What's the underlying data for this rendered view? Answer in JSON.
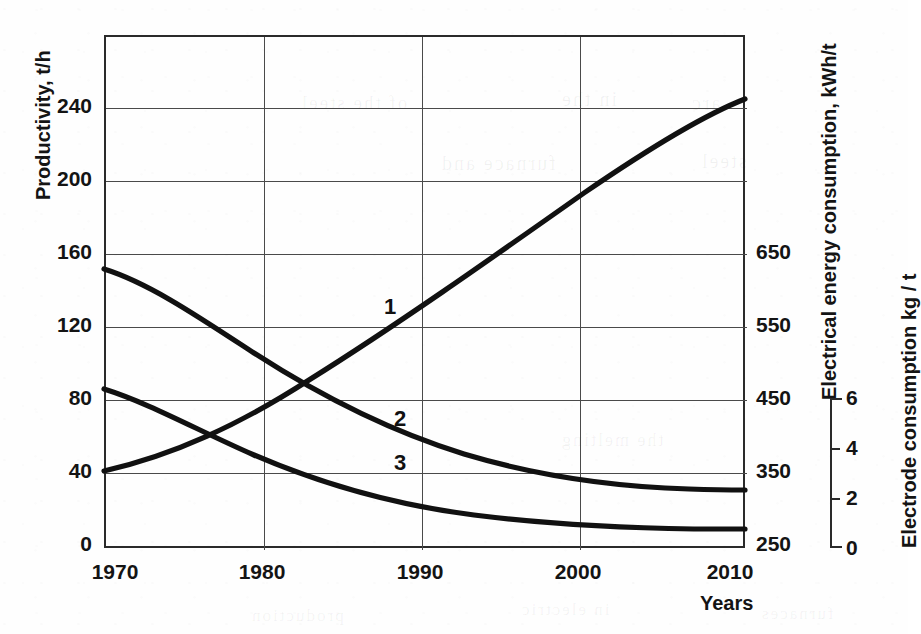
{
  "figure": {
    "background_color": "#fefefe",
    "ink_color": "#111111",
    "grid_color": "#4a4a4a"
  },
  "axes": {
    "x": {
      "title": "Years",
      "ticks": [
        "1970",
        "1980",
        "1990",
        "2000",
        "2010"
      ],
      "range": [
        1969,
        2011
      ]
    },
    "y_left": {
      "title": "Productivity, t/h",
      "ticks": [
        "0",
        "40",
        "80",
        "120",
        "160",
        "200",
        "240"
      ],
      "range": [
        0,
        280
      ]
    },
    "y_right_1": {
      "title": "Electrical energy consumption, kWh/t",
      "ticks": [
        "250",
        "350",
        "450",
        "550",
        "650"
      ],
      "range": [
        250,
        650
      ]
    },
    "y_right_2": {
      "title": "Electrode consumption kg / t",
      "ticks": [
        "0",
        "2",
        "4",
        "6"
      ],
      "range": [
        0,
        6
      ]
    }
  },
  "curve_labels": [
    {
      "text": "1",
      "x_px": 390,
      "y_px": 307
    },
    {
      "text": "2",
      "x_px": 400,
      "y_px": 419
    },
    {
      "text": "3",
      "x_px": 400,
      "y_px": 463
    }
  ],
  "ghost_text": [
    {
      "text": "of the steel",
      "x_px": 300,
      "y_px": 92,
      "size": 19
    },
    {
      "text": "in the",
      "x_px": 560,
      "y_px": 88,
      "size": 20
    },
    {
      "text": "arc",
      "x_px": 690,
      "y_px": 92,
      "size": 20
    },
    {
      "text": "furnace and",
      "x_px": 440,
      "y_px": 152,
      "size": 20
    },
    {
      "text": "steel",
      "x_px": 700,
      "y_px": 150,
      "size": 20
    },
    {
      "text": "the melting",
      "x_px": 560,
      "y_px": 430,
      "size": 18
    },
    {
      "text": "production",
      "x_px": 250,
      "y_px": 606,
      "size": 17
    },
    {
      "text": "in electric",
      "x_px": 520,
      "y_px": 600,
      "size": 17
    },
    {
      "text": "furnaces",
      "x_px": 760,
      "y_px": 604,
      "size": 17
    }
  ],
  "chart_data": {
    "type": "line",
    "title": "",
    "xlabel": "Years",
    "ylabel": "Productivity, t/h",
    "grid": true,
    "legend": "inline-numbered",
    "x": [
      1969,
      1970,
      1975,
      1980,
      1983,
      1985,
      1990,
      1995,
      2000,
      2005,
      2010,
      2011
    ],
    "xlim": [
      1969,
      2011
    ],
    "ylim_left": [
      0,
      280
    ],
    "ylim_right_energy": [
      250,
      650
    ],
    "ylim_right_electrode": [
      0,
      6
    ],
    "series": [
      {
        "name": "1",
        "label": "Productivity",
        "axis": "y_left",
        "units": "t/h",
        "values": [
          41,
          42,
          56,
          72,
          85,
          93,
          120,
          150,
          175,
          205,
          238,
          240
        ]
      },
      {
        "name": "2",
        "label": "Electrical energy consumption",
        "axis": "y_right_1",
        "units": "kWh/t",
        "values_left_scale": [
          152,
          150,
          128,
          108,
          95,
          88,
          70,
          56,
          45,
          38,
          35,
          35
        ],
        "values": [
          630,
          625,
          570,
          520,
          488,
          470,
          425,
          390,
          363,
          345,
          338,
          338
        ]
      },
      {
        "name": "3",
        "label": "Electrode consumption",
        "axis": "y_right_2",
        "units": "kg/t",
        "values_left_scale": [
          87,
          86,
          72,
          58,
          50,
          45,
          33,
          25,
          20,
          17,
          16,
          16
        ],
        "values": [
          5.4,
          5.35,
          4.5,
          3.6,
          3.1,
          2.8,
          2.05,
          1.55,
          1.25,
          1.05,
          1.0,
          1.0
        ]
      }
    ]
  }
}
